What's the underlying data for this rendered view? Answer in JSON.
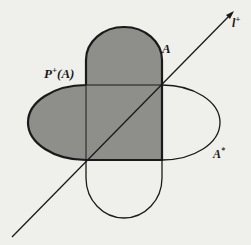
{
  "figure": {
    "labels": {
      "line": "l",
      "line_sup": "+",
      "set_a": "A",
      "set_a_star": "A",
      "set_a_star_sup": "*",
      "projection": "P",
      "projection_sup": "+",
      "projection_arg": "(A)"
    },
    "colors": {
      "background": "#efefeb",
      "shaded_region": "#8e8e8a",
      "stroke": "#1a1a1a"
    }
  }
}
